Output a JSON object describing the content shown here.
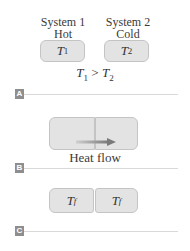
{
  "panel_a": {
    "system1": {
      "name": "System 1",
      "state": "Hot",
      "temp_symbol": "T",
      "temp_sub": "1"
    },
    "system2": {
      "name": "System 2",
      "state": "Cold",
      "temp_symbol": "T",
      "temp_sub": "2"
    },
    "relation": {
      "left": "T",
      "left_sub": "1",
      "op": " > ",
      "right": "T",
      "right_sub": "2"
    },
    "badge": "A"
  },
  "panel_b": {
    "caption": "Heat flow",
    "badge": "B"
  },
  "panel_c": {
    "left": {
      "temp_symbol": "T",
      "temp_sub": "f"
    },
    "right": {
      "temp_symbol": "T",
      "temp_sub": "f"
    },
    "badge": "C"
  },
  "colors": {
    "box_fill": "#e3e3e3",
    "box_border": "#c4c4c4",
    "badge": "#8e8e8e",
    "divider": "#d9d9d9",
    "arrow": "#8a8a8a"
  }
}
